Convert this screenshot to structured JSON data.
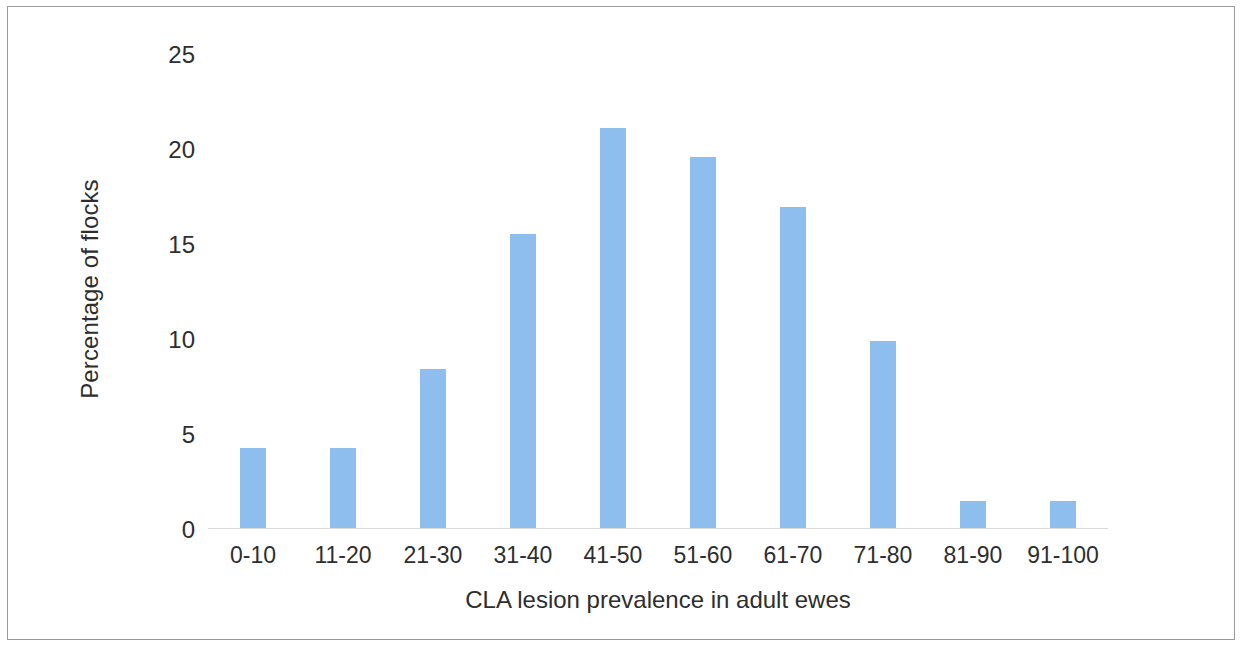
{
  "chart_data": {
    "type": "bar",
    "title": "",
    "xlabel": "CLA lesion prevalence in adult ewes",
    "ylabel": "Percentage of flocks",
    "categories": [
      "0-10",
      "11-20",
      "21-30",
      "31-40",
      "41-50",
      "51-60",
      "61-70",
      "71-80",
      "81-90",
      "91-100"
    ],
    "values": [
      4.1,
      4.1,
      8.2,
      15.1,
      20.6,
      19.1,
      16.5,
      9.6,
      1.4,
      1.4
    ],
    "ylim": [
      0,
      25
    ],
    "ytick_labels": [
      "25",
      "20",
      "15",
      "10",
      "5",
      "0"
    ],
    "ytick_values": [
      25,
      20,
      15,
      10,
      5,
      0
    ],
    "grid": false,
    "legend": "none",
    "bar_color": "#8DBEEE",
    "axis_line_color": "#D9D9D9",
    "text_color": "#2E2E2E",
    "frame_color": "#9A9A9A"
  }
}
